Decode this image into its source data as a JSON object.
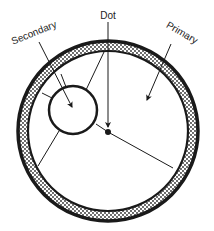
{
  "diagram": {
    "labels": {
      "secondary": "Secondary",
      "dot": "Dot",
      "primary": "Primary"
    },
    "colors": {
      "ink": "#1a1a1a",
      "background": "#ffffff",
      "stipple": "#2a2a2a"
    },
    "geometry": {
      "outer_center": [
        108,
        131
      ],
      "outer_radius": 89,
      "inner_radius": 80,
      "secondary_center": [
        73,
        110
      ],
      "secondary_radius": 24,
      "dot_center": [
        108,
        132
      ]
    }
  }
}
